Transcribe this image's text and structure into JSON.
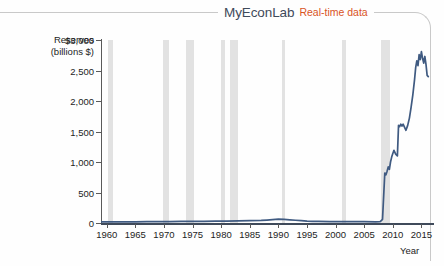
{
  "header": {
    "brand": "MyEconLab",
    "realtime": "Real-time data"
  },
  "chart_data": {
    "type": "line",
    "title": "",
    "ylabel": "Reserves (billions $)",
    "ylabel_line1": "Reserves",
    "ylabel_line2": "(billions $)",
    "xlabel": "Year",
    "xlim": [
      1959,
      2016.5
    ],
    "ylim": [
      0,
      3000
    ],
    "grid": false,
    "legend": "none",
    "line_color": "#3f5a81",
    "band_color": "#dcdcdc",
    "yticks": [
      0,
      500,
      1000,
      1500,
      2000,
      2500,
      3000
    ],
    "ytick_labels": [
      "0",
      "500",
      "1,000",
      "1,500",
      "2,000",
      "2,500",
      "$3,000"
    ],
    "xticks": [
      1960,
      1965,
      1970,
      1975,
      1980,
      1985,
      1990,
      1995,
      2000,
      2005,
      2010,
      2015
    ],
    "xtick_labels": [
      "1960",
      "1965",
      "1970",
      "1975",
      "1980",
      "1985",
      "1990",
      "1995",
      "2000",
      "2005",
      "2010",
      "2015"
    ],
    "recession_bands": [
      {
        "start": 1960.3,
        "end": 1961.1
      },
      {
        "start": 1969.9,
        "end": 1970.9
      },
      {
        "start": 1973.9,
        "end": 1975.2
      },
      {
        "start": 1980.0,
        "end": 1980.6
      },
      {
        "start": 1981.5,
        "end": 1982.9
      },
      {
        "start": 1990.6,
        "end": 1991.2
      },
      {
        "start": 2001.2,
        "end": 2001.9
      },
      {
        "start": 2007.9,
        "end": 2009.5
      }
    ],
    "series": [
      {
        "name": "Reserves",
        "x": [
          1959,
          1961,
          1963,
          1965,
          1967,
          1969,
          1971,
          1973,
          1975,
          1977,
          1979,
          1981,
          1983,
          1985,
          1987,
          1988,
          1989,
          1990,
          1991,
          1992,
          1993,
          1994,
          1995,
          1996,
          1997,
          1999,
          2001,
          2003,
          2005,
          2007,
          2007.8,
          2008.2,
          2008.6,
          2008.8,
          2009.0,
          2009.2,
          2009.4,
          2009.6,
          2009.8,
          2010.0,
          2010.2,
          2010.5,
          2010.8,
          2011.0,
          2011.2,
          2011.4,
          2011.6,
          2011.8,
          2012.0,
          2012.3,
          2012.6,
          2012.9,
          2013.2,
          2013.5,
          2013.8,
          2014.0,
          2014.2,
          2014.4,
          2014.6,
          2014.8,
          2015.0,
          2015.2,
          2015.4,
          2015.6,
          2015.8,
          2016.0,
          2016.2
        ],
        "y": [
          18,
          18,
          19,
          20,
          21,
          22,
          24,
          26,
          27,
          28,
          30,
          32,
          34,
          38,
          42,
          48,
          55,
          62,
          58,
          52,
          45,
          38,
          32,
          28,
          26,
          24,
          22,
          24,
          22,
          20,
          22,
          60,
          820,
          790,
          850,
          920,
          880,
          1000,
          1080,
          1140,
          1190,
          1130,
          1100,
          1600,
          1580,
          1620,
          1590,
          1620,
          1580,
          1520,
          1600,
          1720,
          1900,
          2100,
          2350,
          2550,
          2660,
          2580,
          2760,
          2680,
          2810,
          2700,
          2620,
          2730,
          2600,
          2420,
          2400
        ]
      }
    ]
  }
}
